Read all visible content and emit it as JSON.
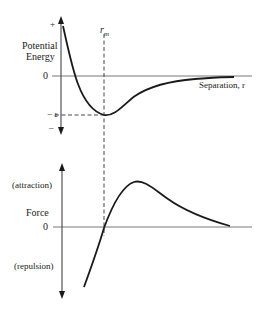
{
  "top_panel": {
    "y_axis_label_line1": "Potential",
    "y_axis_label_line2": "Energy",
    "y_plus": "+",
    "y_zero": "0",
    "y_epsilon": "− ε",
    "y_minus": "–",
    "x_axis_label": "Separation, r",
    "rm_label": "r",
    "rm_sub": "m"
  },
  "bottom_panel": {
    "y_axis_label": "Force",
    "y_zero": "0",
    "attraction_label": "(attraction)",
    "repulsion_label": "(repulsion)"
  },
  "colors": {
    "line": "#1a1a1a",
    "axis": "#444444",
    "background": "#ffffff"
  }
}
